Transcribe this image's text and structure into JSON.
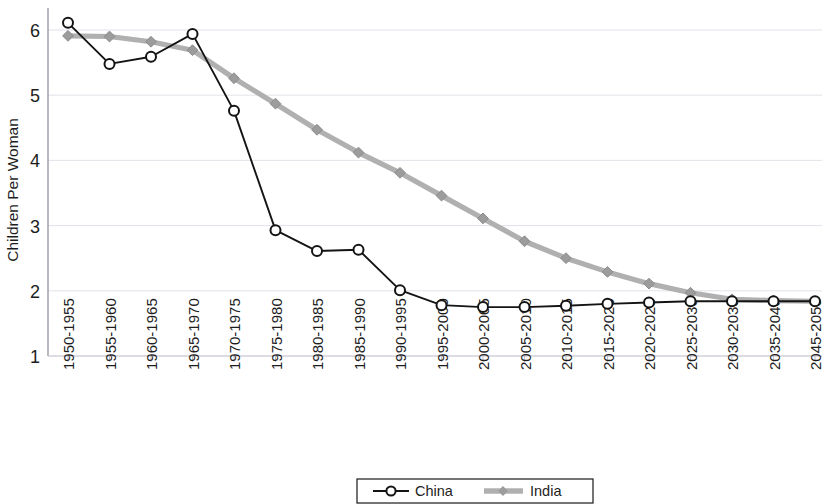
{
  "chart_data": {
    "type": "line",
    "title": "",
    "xlabel": "",
    "ylabel": "Children Per Woman",
    "ylim": [
      1,
      6.4
    ],
    "yticks": [
      1,
      2,
      3,
      4,
      5,
      6
    ],
    "grid": true,
    "legend_position": "bottom",
    "categories": [
      "1950-1955",
      "1955-1960",
      "1960-1965",
      "1965-1970",
      "1970-1975",
      "1975-1980",
      "1980-1985",
      "1985-1990",
      "1990-1995",
      "1995-2000",
      "2000-2005",
      "2005-2010",
      "2010-2015",
      "2015-2020",
      "2020-2025",
      "2025-2030",
      "2030-2035",
      "2035-2040",
      "2045-2050"
    ],
    "series": [
      {
        "name": "China",
        "color": "#141414",
        "marker": "circle-open",
        "values": [
          6.11,
          5.48,
          5.59,
          5.94,
          4.76,
          2.93,
          2.61,
          2.63,
          2.01,
          1.78,
          1.75,
          1.75,
          1.77,
          1.8,
          1.82,
          1.84,
          1.84,
          1.84,
          1.84
        ]
      },
      {
        "name": "India",
        "color": "#b0b0b0",
        "marker": "diamond",
        "values": [
          5.91,
          5.9,
          5.82,
          5.69,
          5.26,
          4.87,
          4.47,
          4.12,
          3.81,
          3.46,
          3.11,
          2.76,
          2.5,
          2.29,
          2.11,
          1.97,
          1.87,
          1.85,
          1.84
        ]
      }
    ],
    "legend": [
      {
        "label": "China",
        "style": "line-marker"
      },
      {
        "label": "India",
        "style": "thick-line"
      }
    ]
  },
  "chart": {
    "y_axis_title": "Children Per Woman"
  }
}
